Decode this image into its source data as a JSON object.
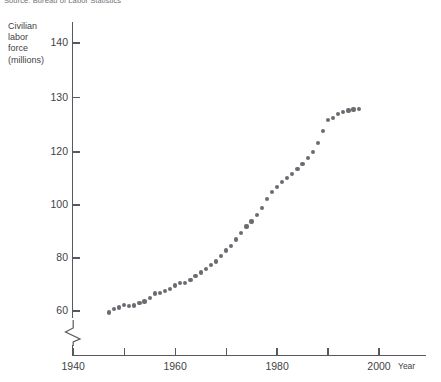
{
  "source_note": "Source: Bureau of Labor Statistics",
  "axis_title_lines": [
    "Civilian",
    "labor",
    "force",
    "(millions)"
  ],
  "x_axis_name": "Year",
  "chart_data": {
    "type": "scatter",
    "title": "",
    "subtitle": "",
    "source": "Source: Bureau of Labor Statistics",
    "xlabel": "Year",
    "ylabel": "Civilian labor force (millions)",
    "xlim": [
      1940,
      2002
    ],
    "ylim": [
      58,
      143
    ],
    "grid": false,
    "legend": null,
    "axis_break": {
      "y": true,
      "x": false,
      "note": "y-axis broken below 60; scale compressed between 100 and 120"
    },
    "y_ticks": [
      60,
      80,
      100,
      120,
      130,
      140
    ],
    "x_ticks": [
      1940,
      1950,
      1960,
      1970,
      1980,
      1990,
      2000
    ],
    "x_tick_labels": [
      "1940",
      "",
      "1960",
      "",
      "1980",
      "",
      "2000"
    ],
    "marker": {
      "shape": "circle",
      "color": "#6b6b72",
      "size": 4.2
    },
    "x": [
      1947,
      1948,
      1949,
      1950,
      1951,
      1952,
      1953,
      1954,
      1955,
      1956,
      1957,
      1958,
      1959,
      1960,
      1961,
      1962,
      1963,
      1964,
      1965,
      1966,
      1967,
      1968,
      1969,
      1970,
      1971,
      1972,
      1973,
      1974,
      1975,
      1976,
      1977,
      1978,
      1979,
      1980,
      1981,
      1982,
      1983,
      1984,
      1985,
      1986,
      1987,
      1988,
      1989,
      1990,
      1991,
      1992,
      1993,
      1994,
      1995,
      1996
    ],
    "y": [
      59.4,
      60.6,
      61.3,
      62.2,
      62.0,
      62.1,
      63.0,
      63.6,
      65.0,
      66.6,
      66.9,
      67.6,
      68.4,
      69.6,
      70.5,
      70.6,
      71.8,
      73.1,
      74.5,
      75.8,
      77.3,
      78.7,
      80.7,
      82.8,
      84.4,
      87.0,
      89.4,
      91.9,
      93.8,
      96.2,
      99.0,
      102.2,
      105.0,
      106.9,
      108.7,
      110.2,
      111.6,
      113.5,
      115.5,
      117.8,
      119.9,
      121.7,
      123.9,
      125.8,
      126.3,
      127.0,
      127.3,
      127.6,
      127.8,
      127.9
    ]
  }
}
